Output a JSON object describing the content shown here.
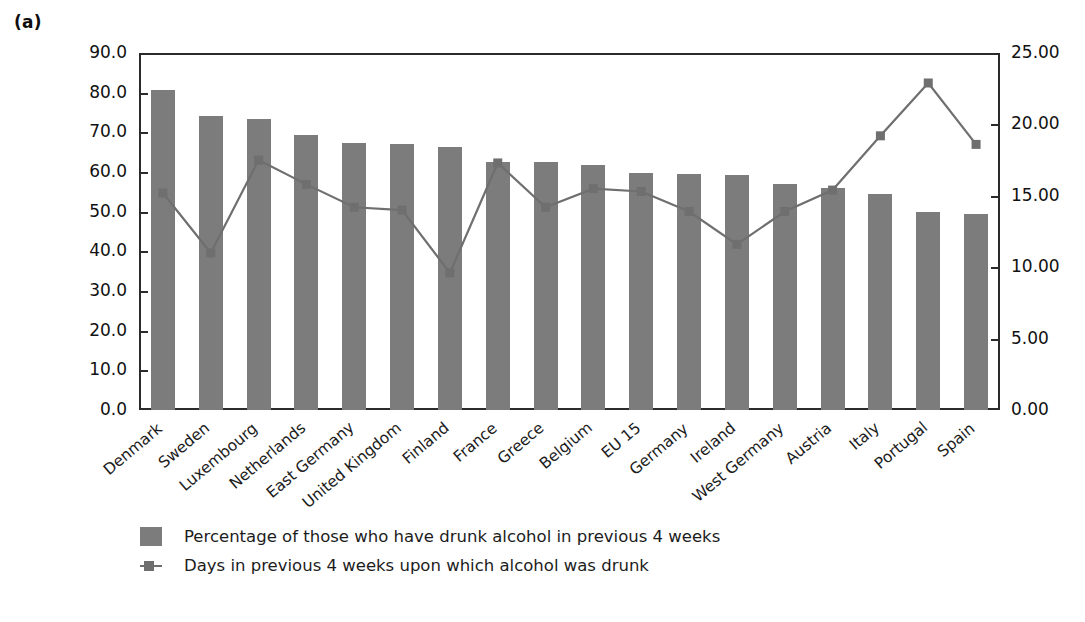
{
  "figure": {
    "panel_label": "(a)"
  },
  "chart_data": {
    "type": "bar",
    "title": "",
    "xlabel": "",
    "ylabel": "",
    "y2label": "",
    "grid": false,
    "legend_position": "bottom-left",
    "ylim": [
      0.0,
      90.0
    ],
    "y2lim": [
      0.0,
      25.0
    ],
    "y_ticks": [
      "0.0",
      "10.0",
      "20.0",
      "30.0",
      "40.0",
      "50.0",
      "60.0",
      "70.0",
      "80.0",
      "90.0"
    ],
    "y2_ticks": [
      "0.00",
      "5.00",
      "10.00",
      "15.00",
      "20.00",
      "25.00"
    ],
    "categories": [
      "Denmark",
      "Sweden",
      "Luxembourg",
      "Netherlands",
      "East Germany",
      "United Kingdom",
      "Finland",
      "France",
      "Greece",
      "Belgium",
      "EU 15",
      "Germany",
      "Ireland",
      "West Germany",
      "Austria",
      "Italy",
      "Portugal",
      "Spain"
    ],
    "series": [
      {
        "name": "Percentage of those who have drunk alcohol in previous 4 weeks",
        "type": "bar",
        "axis": "left",
        "color": "#7c7c7c",
        "values": [
          80.8,
          74.0,
          73.3,
          69.4,
          67.3,
          67.1,
          66.2,
          62.6,
          62.6,
          61.8,
          59.7,
          59.4,
          59.3,
          57.0,
          56.0,
          54.5,
          49.8,
          49.4
        ]
      },
      {
        "name": "Days in previous 4 weeks upon which alcohol was drunk",
        "type": "line",
        "axis": "right",
        "color": "#6f6f6f",
        "values": [
          15.2,
          11.0,
          17.5,
          15.8,
          14.2,
          14.0,
          9.6,
          17.3,
          14.2,
          15.5,
          15.3,
          13.9,
          11.6,
          13.9,
          15.4,
          19.2,
          22.9,
          18.6
        ]
      }
    ]
  },
  "legend": {
    "items": [
      {
        "marker": "bar-swatch",
        "label": "Percentage of those who have drunk alcohol in previous 4 weeks"
      },
      {
        "marker": "line-square-marker",
        "label": "Days in previous 4 weeks upon which alcohol was drunk"
      }
    ]
  }
}
